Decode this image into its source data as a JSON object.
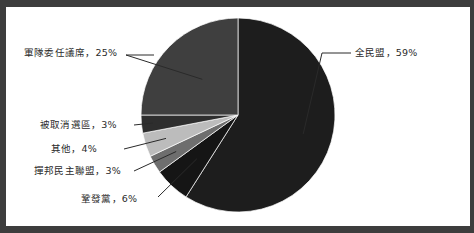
{
  "figure": {
    "background_color": "#3d3d3d",
    "plot_background_color": "#ffffff",
    "border_color": "#3d3d3d"
  },
  "chart_data": {
    "type": "pie",
    "title": "",
    "subtitle": "",
    "xlabel": "",
    "ylabel": "",
    "legend_position": "none",
    "grid": false,
    "label_separator": "，",
    "start_angle_deg": 0,
    "direction": "clockwise",
    "center": {
      "x": 232,
      "y": 108
    },
    "radius": 97,
    "categories": [
      "全民盟",
      "鞏發黨",
      "撣邦民主聯盟",
      "其他",
      "被取消選區",
      "軍隊委任議席"
    ],
    "values": [
      59,
      6,
      3,
      4,
      3,
      25
    ],
    "unit": "%",
    "slices": [
      {
        "name": "全民盟",
        "value": 59,
        "label": "全民盟，59%",
        "percent_text": "59%",
        "color": "#1d1d1d",
        "label_side": "right"
      },
      {
        "name": "鞏發黨",
        "value": 6,
        "label": "鞏發黨，6%",
        "percent_text": "6%",
        "color": "#151515",
        "label_side": "left"
      },
      {
        "name": "撣邦民主聯盟",
        "value": 3,
        "label": "撣邦民主聯盟，3%",
        "percent_text": "3%",
        "color": "#6e6e6e",
        "label_side": "left"
      },
      {
        "name": "其他",
        "value": 4,
        "label": "其他，4%",
        "percent_text": "4%",
        "color": "#bcbcbc",
        "label_side": "left"
      },
      {
        "name": "被取消選區",
        "value": 3,
        "label": "被取消選區，3%",
        "percent_text": "3%",
        "color": "#2e2e2e",
        "label_side": "left"
      },
      {
        "name": "軍隊委任議席",
        "value": 25,
        "label": "軍隊委任議席，25%",
        "percent_text": "25%",
        "color": "#3f3f3f",
        "label_side": "left"
      }
    ]
  }
}
